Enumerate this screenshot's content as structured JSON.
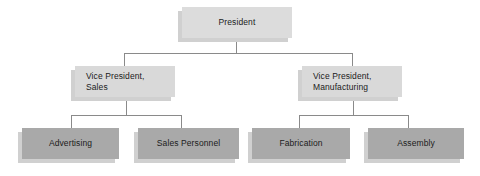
{
  "chart": {
    "type": "org-chart",
    "levels": 3,
    "colors": {
      "level1_fill": "#dcdcdc",
      "level2_fill": "#d9d9d9",
      "level3_fill": "#a9a9a9",
      "shadow": "#d0d0d0",
      "connector": "#8a8a8a",
      "text": "#1b1b1b",
      "background": "#ffffff"
    },
    "nodes": {
      "president": {
        "label": "President",
        "level": 1
      },
      "vp_sales": {
        "line1": "Vice President,",
        "line2": "Sales",
        "level": 2
      },
      "vp_manufacturing": {
        "line1": "Vice President,",
        "line2": "Manufacturing",
        "level": 2
      },
      "advertising": {
        "label": "Advertising",
        "level": 3
      },
      "sales_personnel": {
        "label": "Sales Personnel",
        "level": 3
      },
      "fabrication": {
        "label": "Fabrication",
        "level": 3
      },
      "assembly": {
        "label": "Assembly",
        "level": 3
      }
    },
    "edges": [
      {
        "from": "president",
        "to": "vp_sales"
      },
      {
        "from": "president",
        "to": "vp_manufacturing"
      },
      {
        "from": "vp_sales",
        "to": "advertising"
      },
      {
        "from": "vp_sales",
        "to": "sales_personnel"
      },
      {
        "from": "vp_manufacturing",
        "to": "fabrication"
      },
      {
        "from": "vp_manufacturing",
        "to": "assembly"
      }
    ]
  }
}
